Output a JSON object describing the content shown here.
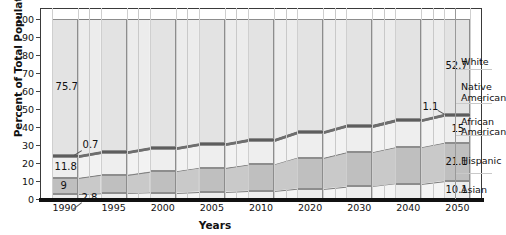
{
  "chart_data": {
    "type": "bar",
    "title": "",
    "subtitle": "",
    "xlabel": "Years",
    "ylabel": "Percent of Total Population",
    "ylim": [
      0,
      100
    ],
    "yticks": [
      0,
      10,
      20,
      30,
      40,
      50,
      60,
      70,
      80,
      90,
      100
    ],
    "grid": true,
    "legend_position": "right",
    "stacked": true,
    "categories": [
      "1990",
      "1995",
      "2000",
      "2005",
      "2010",
      "2020",
      "2030",
      "2040",
      "2050"
    ],
    "series": [
      {
        "name": "Asian",
        "values": [
          2.8,
          3.2,
          3.6,
          4.1,
          4.6,
          5.8,
          7.0,
          8.5,
          10.1
        ]
      },
      {
        "name": "Hispanic",
        "values": [
          9.0,
          10.4,
          11.8,
          13.2,
          14.6,
          17.1,
          19.0,
          20.2,
          21.1
        ]
      },
      {
        "name": "African American",
        "values": [
          11.8,
          12.2,
          12.6,
          12.9,
          13.2,
          13.8,
          14.2,
          14.6,
          15.0
        ]
      },
      {
        "name": "Native American",
        "values": [
          0.7,
          0.7,
          0.8,
          0.8,
          0.9,
          0.9,
          1.0,
          1.0,
          1.1
        ]
      },
      {
        "name": "White",
        "values": [
          75.7,
          73.5,
          71.2,
          69.0,
          66.7,
          62.4,
          58.8,
          55.7,
          52.7
        ]
      }
    ],
    "annotations": [
      {
        "text": "75.7",
        "series": "White",
        "category": "1990"
      },
      {
        "text": "11.8",
        "series": "African American",
        "category": "1990"
      },
      {
        "text": "9",
        "series": "Hispanic",
        "category": "1990"
      },
      {
        "text": "2.8",
        "series": "Asian",
        "category": "1990"
      },
      {
        "text": "0.7",
        "series": "Native American",
        "category": "1990"
      },
      {
        "text": "52.7",
        "series": "White",
        "category": "2050"
      },
      {
        "text": "1.1",
        "series": "Native American",
        "category": "2050"
      },
      {
        "text": "15",
        "series": "African American",
        "category": "2050"
      },
      {
        "text": "21.1",
        "series": "Hispanic",
        "category": "2050"
      },
      {
        "text": "10.1",
        "series": "Asian",
        "category": "2050"
      }
    ],
    "legend_entries": [
      "White",
      "Native American",
      "African American",
      "Hispanic",
      "Asian"
    ],
    "colors": {
      "white_band": "#e3e3e3",
      "native_band": "#7c7c7c",
      "african_american_band": "#eeeeee",
      "hispanic_band": "#bfbfbf",
      "asian_band": "#ededed",
      "grid": "#c9c9c9",
      "axis": "#111111"
    }
  },
  "axis": {
    "y_title": "Percent of Total Population",
    "x_title": "Years",
    "y_ticks": [
      "0",
      "10",
      "20",
      "30",
      "40",
      "50",
      "60",
      "70",
      "80",
      "90",
      "100"
    ],
    "x_ticks": [
      "1990",
      "1995",
      "2000",
      "2005",
      "2010",
      "2020",
      "2030",
      "2040",
      "2050"
    ]
  },
  "labels": {
    "l_75_7": "75.7",
    "l_0_7": "0.7",
    "l_11_8": "11.8",
    "l_9": "9",
    "l_2_8": "2.8",
    "l_52_7": "52.7",
    "l_1_1": "1.1",
    "l_15": "15",
    "l_21_1": "21.1",
    "l_10_1": "10.1"
  },
  "legend": {
    "white": "White",
    "native_american_line1": "Native",
    "native_american_line2": "American",
    "african_american_line1": "African",
    "african_american_line2": "American",
    "hispanic": "Hispanic",
    "asian": "Asian"
  }
}
